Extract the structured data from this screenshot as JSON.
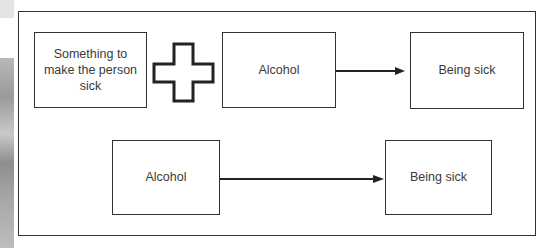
{
  "diagram": {
    "row1": {
      "cause_box": {
        "label": "Something to make the person sick"
      },
      "operator": {
        "icon": "plus-icon"
      },
      "alcohol_box": {
        "label": "Alcohol"
      },
      "arrow": {
        "icon": "arrow-right-icon"
      },
      "result_box": {
        "label": "Being sick"
      }
    },
    "row2": {
      "alcohol_box": {
        "label": "Alcohol"
      },
      "arrow": {
        "icon": "arrow-right-icon"
      },
      "result_box": {
        "label": "Being sick"
      }
    }
  },
  "colors": {
    "stroke": "#333333",
    "text": "#3a3a3a",
    "background": "#ffffff"
  }
}
